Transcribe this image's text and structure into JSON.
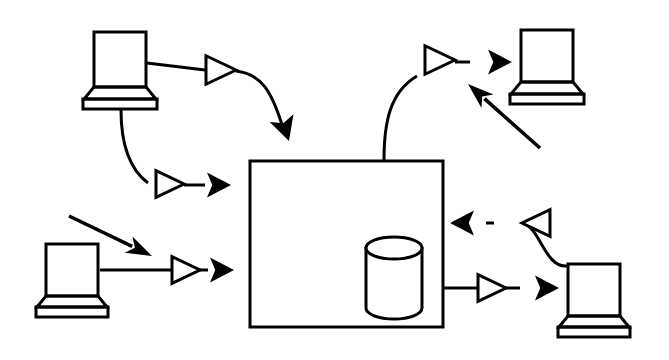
{
  "figure": {
    "style": "black and white line art",
    "background_color": "#ffffff",
    "stroke_color": "#000000",
    "width": 669,
    "height": 360
  },
  "nodes": {
    "server": {
      "name": "central-server-box",
      "shape": "rectangle",
      "x": 250,
      "y": 161,
      "width": 193,
      "height": 166,
      "stroke_width": 3
    },
    "database": {
      "name": "database-cylinder",
      "shape": "cylinder",
      "x": 366,
      "y": 237,
      "width": 56,
      "height": 82,
      "ellipse_ry": 11,
      "stroke_width": 3
    },
    "terminals": [
      {
        "id": "terminal-top-left",
        "label": "top-left-terminal",
        "screen_x": 94,
        "screen_y": 32,
        "screen_w": 52,
        "screen_h": 55,
        "neck_top_w": 52,
        "neck_bottom_w": 72,
        "neck_h": 12,
        "base_w": 74,
        "base_h": 10,
        "stroke_width": 3
      },
      {
        "id": "terminal-top-right",
        "label": "top-right-terminal",
        "screen_x": 521,
        "screen_y": 30,
        "screen_w": 52,
        "screen_h": 52,
        "neck_top_w": 52,
        "neck_bottom_w": 72,
        "neck_h": 12,
        "base_w": 74,
        "base_h": 10,
        "stroke_width": 3
      },
      {
        "id": "terminal-bottom-left",
        "label": "bottom-left-terminal",
        "screen_x": 46,
        "screen_y": 244,
        "screen_w": 52,
        "screen_h": 52,
        "neck_top_w": 52,
        "neck_bottom_w": 70,
        "neck_h": 11,
        "base_w": 72,
        "base_h": 10,
        "stroke_width": 3
      },
      {
        "id": "terminal-bottom-right",
        "label": "bottom-right-terminal",
        "screen_x": 568,
        "screen_y": 264,
        "screen_w": 52,
        "screen_h": 52,
        "neck_top_w": 52,
        "neck_bottom_w": 70,
        "neck_h": 11,
        "base_w": 72,
        "base_h": 10,
        "stroke_width": 3
      }
    ]
  },
  "flows": [
    {
      "id": "flow-topleft-to-server",
      "label": "top-left terminal to server (inbound)",
      "from": "terminal-top-left",
      "to": "central-server-box",
      "path": "M 147 63 L 205 70",
      "gateway": {
        "x": 206,
        "y": 70,
        "size": 30,
        "direction": "right"
      },
      "tail": "M 236 71 C 262 74 272 92 283 128",
      "arrowhead": {
        "x": 289,
        "y": 141,
        "angle": 72,
        "size": 24,
        "style": "solid"
      }
    },
    {
      "id": "flow-topleft-to-server-secondary",
      "label": "top-left terminal base to server left edge",
      "from": "terminal-top-left",
      "to": "central-server-box",
      "path": "M 121 110 C 121 140 128 168 148 183",
      "gateway": {
        "x": 156,
        "y": 184,
        "size": 28,
        "direction": "right"
      },
      "tail": "M 184 185 L 205 185",
      "arrowhead": {
        "x": 231,
        "y": 185,
        "angle": 0,
        "size": 24,
        "style": "solid"
      }
    },
    {
      "id": "flow-bottomleft-to-server",
      "label": "bottom-left terminal to server left edge",
      "from": "terminal-bottom-left",
      "to": "central-server-box",
      "path": "M 100 270 L 171 270",
      "gateway": {
        "x": 172,
        "y": 270,
        "size": 28,
        "direction": "right"
      },
      "tail": "M 200 270 L 208 270",
      "arrowhead": {
        "x": 234,
        "y": 270,
        "angle": 0,
        "size": 24,
        "style": "solid"
      }
    },
    {
      "id": "flow-server-to-topright",
      "label": "server to top-right terminal (outbound)",
      "from": "central-server-box",
      "to": "terminal-top-right",
      "path": "M 384 160 C 384 122 390 92 417 76",
      "gateway": {
        "x": 425,
        "y": 60,
        "size": 30,
        "direction": "right"
      },
      "tail": "M 455 62 L 470 62",
      "arrowhead": {
        "x": 512,
        "y": 62,
        "angle": 0,
        "size": 24,
        "style": "solid"
      }
    },
    {
      "id": "flow-server-to-bottomright",
      "label": "server to bottom-right terminal (outbound)",
      "from": "central-server-box",
      "to": "terminal-bottom-right",
      "path": "M 444 288 L 477 288",
      "gateway": {
        "x": 478,
        "y": 288,
        "size": 28,
        "direction": "right"
      },
      "tail": "M 506 288 L 520 288",
      "arrowhead": {
        "x": 559,
        "y": 288,
        "angle": 0,
        "size": 24,
        "style": "solid"
      }
    },
    {
      "id": "flow-bottomright-to-server",
      "label": "bottom-right terminal to server right edge (return)",
      "from": "terminal-bottom-right",
      "to": "central-server-box",
      "path": "M 567 266 C 545 268 540 228 524 224",
      "gateway": {
        "x": 522,
        "y": 223,
        "size": 28,
        "direction": "left"
      },
      "tail": "M 494 223 L 486 223",
      "arrowhead": {
        "x": 450,
        "y": 223,
        "angle": 180,
        "size": 24,
        "style": "solid"
      }
    }
  ],
  "annotations": [
    {
      "id": "annotation-arrow-top-right",
      "label": "pointer arrow aimed up-left near top-right flow",
      "from_x": 540,
      "from_y": 148,
      "to_x": 468,
      "to_y": 84,
      "style": "thin-solid-arrow"
    },
    {
      "id": "annotation-arrow-bottom-left",
      "label": "pointer arrow aimed down-right near bottom-left terminal",
      "from_x": 69,
      "from_y": 216,
      "to_x": 152,
      "to_y": 256,
      "style": "thin-solid-arrow"
    }
  ]
}
